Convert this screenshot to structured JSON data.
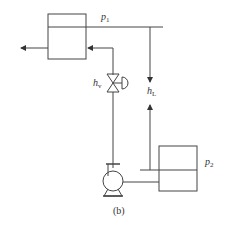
{
  "diagram": {
    "caption": "(b)",
    "labels": {
      "p1": {
        "base": "p",
        "sub": "1"
      },
      "p2": {
        "base": "p",
        "sub": "2"
      },
      "hv": {
        "base": "h",
        "sub": "v"
      },
      "hL": {
        "base": "h",
        "sub": "L"
      }
    },
    "components": [
      "upper-tank",
      "lower-tank",
      "control-valve",
      "centrifugal-pump"
    ],
    "colors": {
      "line": "#444444",
      "background": "#ffffff"
    }
  }
}
